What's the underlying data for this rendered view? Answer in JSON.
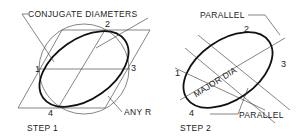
{
  "figure": {
    "step1": {
      "caption": "STEP 1",
      "labels": {
        "conjugate": "CONJUGATE DIAMETERS",
        "any_r": "ANY R",
        "p1": "1",
        "p2": "2",
        "p3": "3",
        "p4": "4"
      }
    },
    "step2": {
      "caption": "STEP 2",
      "labels": {
        "parallel_top": "PARALLEL",
        "parallel_bottom": "PARALLEL",
        "major_dia": "MAJOR DIA",
        "p1": "1",
        "p2": "2",
        "p3": "3",
        "p4": "4"
      }
    }
  }
}
